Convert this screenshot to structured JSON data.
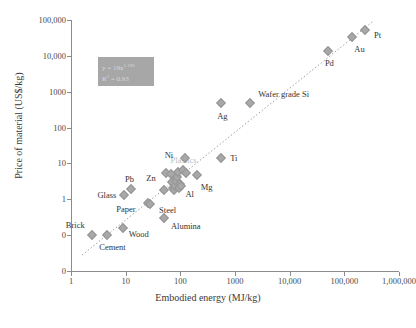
{
  "chart_data": {
    "type": "scatter",
    "title": "",
    "xlabel": "Embodied energy (MJ/kg)",
    "ylabel": "Price of material (US$/kg)",
    "xscale": "log",
    "yscale": "log",
    "xlim": [
      1,
      1000000
    ],
    "ylim": [
      0.01,
      100000
    ],
    "xticks": [
      "1",
      "10",
      "100",
      "1000",
      "10,000",
      "100,000",
      "1,000,000"
    ],
    "xtick_values": [
      1,
      10,
      100,
      1000,
      10000,
      100000,
      1000000
    ],
    "yticks": [
      "100,000",
      "10,000",
      "1000",
      "100",
      "10",
      "1",
      "0",
      "0"
    ],
    "ytick_values": [
      100000,
      10000,
      1000,
      100,
      10,
      1,
      0.1,
      0.01
    ],
    "grid": false,
    "legend": "none",
    "annotation": {
      "equation": "y = 19x",
      "equation_exponent": "1.196",
      "r_squared_label": "R",
      "r_squared_sup": "2",
      "r_squared_value": " = 0.93"
    },
    "trendline": {
      "type": "power-law-dotted",
      "x_start": 1.6,
      "y_start": 0.028,
      "x_end": 330000,
      "y_end": 90000
    },
    "points": [
      {
        "label": "Brick",
        "x": 2.4,
        "y": 0.1,
        "label_dx": -26,
        "label_dy": -10,
        "faint": false
      },
      {
        "label": "Cement",
        "x": 4.6,
        "y": 0.1,
        "label_dx": -8,
        "label_dy": 12,
        "faint": false
      },
      {
        "label": "Wood",
        "x": 8.8,
        "y": 0.16,
        "label_dx": 6,
        "label_dy": 6,
        "faint": false
      },
      {
        "label": "Glass",
        "x": 9.5,
        "y": 1.3,
        "label_dx": -27,
        "label_dy": 0,
        "faint": false
      },
      {
        "label": "Pb",
        "x": 12.5,
        "y": 1.9,
        "label_dx": -6,
        "label_dy": -10,
        "faint": false
      },
      {
        "label": "Paper",
        "x": 26,
        "y": 0.78,
        "label_dx": -32,
        "label_dy": 6,
        "faint": false
      },
      {
        "label": "Steel",
        "x": 28,
        "y": 0.75,
        "label_dx": 9,
        "label_dy": 6,
        "faint": false
      },
      {
        "label": "Alumina",
        "x": 50,
        "y": 0.3,
        "label_dx": 7,
        "label_dy": 8,
        "faint": false
      },
      {
        "label": "Zn",
        "x": 51,
        "y": 1.8,
        "label_dx": -18,
        "label_dy": -12,
        "faint": false
      },
      {
        "label": "",
        "x": 55,
        "y": 5.4,
        "label_dx": 0,
        "label_dy": 0,
        "faint": false
      },
      {
        "label": "",
        "x": 68,
        "y": 5.1,
        "label_dx": 0,
        "label_dy": 0,
        "faint": false
      },
      {
        "label": "",
        "x": 70,
        "y": 3.0,
        "label_dx": 0,
        "label_dy": 0,
        "faint": false
      },
      {
        "label": "",
        "x": 72,
        "y": 2.1,
        "label_dx": 0,
        "label_dy": 0,
        "faint": false
      },
      {
        "label": "",
        "x": 76,
        "y": 1.85,
        "label_dx": 0,
        "label_dy": 0,
        "faint": false
      },
      {
        "label": "",
        "x": 80,
        "y": 2.4,
        "label_dx": 0,
        "label_dy": 0,
        "faint": false
      },
      {
        "label": "",
        "x": 84,
        "y": 3.3,
        "label_dx": 0,
        "label_dy": 0,
        "faint": false
      },
      {
        "label": "",
        "x": 88,
        "y": 4.3,
        "label_dx": 0,
        "label_dy": 0,
        "faint": false
      },
      {
        "label": "",
        "x": 92,
        "y": 5.6,
        "label_dx": 0,
        "label_dy": 0,
        "faint": false
      },
      {
        "label": "",
        "x": 95,
        "y": 2.0,
        "label_dx": 0,
        "label_dy": 0,
        "faint": false
      },
      {
        "label": "",
        "x": 100,
        "y": 2.6,
        "label_dx": 0,
        "label_dy": 0,
        "faint": false
      },
      {
        "label": "Al",
        "x": 105,
        "y": 2.3,
        "label_dx": 4,
        "label_dy": 8,
        "faint": false
      },
      {
        "label": "Plastics",
        "x": 110,
        "y": 6.5,
        "label_dx": -12,
        "label_dy": -10,
        "faint": true
      },
      {
        "label": "Ni",
        "x": 120,
        "y": 14.5,
        "label_dx": -20,
        "label_dy": -3,
        "faint": false
      },
      {
        "label": "",
        "x": 125,
        "y": 5.5,
        "label_dx": 0,
        "label_dy": 0,
        "faint": false
      },
      {
        "label": "Mg",
        "x": 200,
        "y": 4.9,
        "label_dx": 4,
        "label_dy": 12,
        "faint": false
      },
      {
        "label": "Ag",
        "x": 560,
        "y": 480,
        "label_dx": -4,
        "label_dy": 13,
        "faint": false
      },
      {
        "label": "Ti",
        "x": 560,
        "y": 14,
        "label_dx": 9,
        "label_dy": 0,
        "faint": false
      },
      {
        "label": "Wafer grade Si",
        "x": 1900,
        "y": 500,
        "label_dx": 8,
        "label_dy": -9,
        "faint": false
      },
      {
        "label": "Pd",
        "x": 50000,
        "y": 14000,
        "label_dx": -3,
        "label_dy": 12,
        "faint": false
      },
      {
        "label": "Au",
        "x": 140000,
        "y": 33000,
        "label_dx": 2,
        "label_dy": 12,
        "faint": false
      },
      {
        "label": "Pt",
        "x": 240000,
        "y": 52000,
        "label_dx": 9,
        "label_dy": 5,
        "faint": false
      }
    ]
  }
}
